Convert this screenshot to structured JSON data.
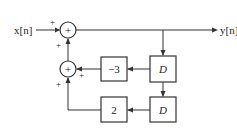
{
  "diagram": {
    "type": "block-diagram",
    "input": {
      "label": "x[n]",
      "base": "x",
      "index": "n"
    },
    "output": {
      "label": "y[n]",
      "base": "y",
      "index": "n"
    },
    "adders": [
      {
        "id": "adder-top",
        "symbol": "+",
        "input_signs": {
          "left": "+",
          "bottom": "+"
        }
      },
      {
        "id": "adder-bottom",
        "symbol": "+",
        "input_signs": {
          "right": "+",
          "bottom": "+"
        }
      }
    ],
    "blocks": [
      {
        "id": "gain-neg3",
        "label": "−3"
      },
      {
        "id": "delay-1",
        "label": "D"
      },
      {
        "id": "gain-2",
        "label": "2"
      },
      {
        "id": "delay-2",
        "label": "D"
      }
    ],
    "signs": {
      "plus": "+"
    }
  }
}
